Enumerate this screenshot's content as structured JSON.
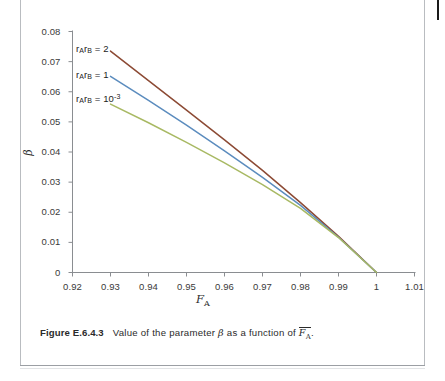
{
  "figure": {
    "caption_label": "Figure E.6.4.3",
    "caption_text_before": "Value of the parameter",
    "caption_beta": "β",
    "caption_text_middle": "as a function of",
    "caption_fbar_base": "F",
    "caption_fbar_sub": "A",
    "caption_text_end": "."
  },
  "chart_data": {
    "type": "line",
    "title": "",
    "xlabel": "F_A",
    "xlabel_base": "F",
    "xlabel_sub": "A",
    "ylabel": "β",
    "xlim": [
      0.92,
      1.01
    ],
    "ylim": [
      0,
      0.08
    ],
    "grid": false,
    "legend_position": "inline-left",
    "xticks": [
      "0.92",
      "0.93",
      "0.94",
      "0.95",
      "0.96",
      "0.97",
      "0.98",
      "0.99",
      "1",
      "1.01"
    ],
    "xtick_values": [
      0.92,
      0.93,
      0.94,
      0.95,
      0.96,
      0.97,
      0.98,
      0.99,
      1.0,
      1.01
    ],
    "yticks": [
      "0",
      "0.01",
      "0.02",
      "0.03",
      "0.04",
      "0.05",
      "0.06",
      "0.07",
      "0.08"
    ],
    "ytick_values": [
      0,
      0.01,
      0.02,
      0.03,
      0.04,
      0.05,
      0.06,
      0.07,
      0.08
    ],
    "x": [
      0.93,
      0.94,
      0.95,
      0.96,
      0.97,
      0.98,
      0.99,
      1.0
    ],
    "series": [
      {
        "name": "rArB = 2",
        "label_base": "r",
        "label_sub1": "A",
        "label_base2": "r",
        "label_sub2": "B",
        "label_eq": "= 2",
        "color": "#8c4a34",
        "values": [
          0.0735,
          0.0637,
          0.0539,
          0.044,
          0.0339,
          0.0232,
          0.012,
          0.0
        ]
      },
      {
        "name": "rArB = 1",
        "label_base": "r",
        "label_sub1": "A",
        "label_base2": "r",
        "label_sub2": "B",
        "label_eq": "= 1",
        "color": "#5b8cbe",
        "values": [
          0.0651,
          0.0571,
          0.0489,
          0.0404,
          0.0316,
          0.0223,
          0.0117,
          0.0
        ]
      },
      {
        "name": "rArB = 10^-3",
        "label_base": "r",
        "label_sub1": "A",
        "label_base2": "r",
        "label_sub2": "B",
        "label_eq": "= 10",
        "label_exp": "-3",
        "color": "#a8b963",
        "values": [
          0.0559,
          0.0497,
          0.0432,
          0.0364,
          0.0292,
          0.0213,
          0.0116,
          0.0
        ]
      }
    ]
  },
  "colors": {
    "series_red": "#8c4a34",
    "series_blue": "#5b8cbe",
    "series_green": "#a8b963",
    "axis": "#8a8d91",
    "text": "#2b2b2b",
    "page_border": "#b9bcc0"
  }
}
